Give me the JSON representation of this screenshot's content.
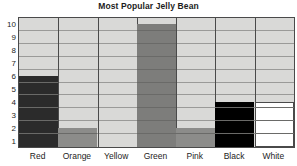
{
  "chart_data": {
    "type": "bar",
    "title": "Most Popular Jelly Bean",
    "xlabel": "",
    "ylabel": "",
    "categories": [
      "Red",
      "Orange",
      "Yellow",
      "Green",
      "Pink",
      "Black",
      "White"
    ],
    "values": [
      5,
      1,
      0,
      9,
      1,
      3,
      3
    ],
    "ylim": [
      0,
      10
    ],
    "yticks": [
      "1",
      "2",
      "3",
      "4",
      "5",
      "6",
      "7",
      "8",
      "9",
      "10"
    ],
    "grid": true,
    "legend": null,
    "bar_colors": [
      "#2b2b2b",
      "#8c8c8a",
      "#d9d9d7",
      "#7d7d7b",
      "#8c8c8a",
      "#000000",
      "#ffffff"
    ],
    "plot_background": "#d9d9d7",
    "axis_color": "#4a4a4a",
    "gridline_color": "#9a9a98",
    "text_color": "#1d1d1d"
  }
}
